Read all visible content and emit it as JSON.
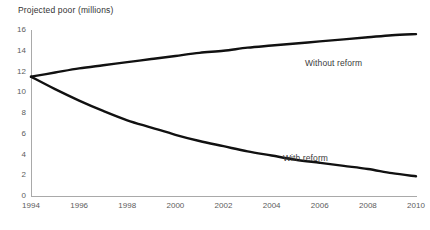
{
  "chart_data": {
    "type": "line",
    "title": "Projected poor (millions)",
    "xlabel": "",
    "ylabel": "Projected poor (millions)",
    "xlim": [
      1994,
      2010
    ],
    "ylim": [
      0,
      16
    ],
    "grid": false,
    "legend_position": "inline-annotation",
    "xticks": [
      "1994",
      "1996",
      "1998",
      "2000",
      "2002",
      "2004",
      "2006",
      "2008",
      "2010"
    ],
    "yticks": [
      "0",
      "2",
      "4",
      "6",
      "8",
      "10",
      "12",
      "14",
      "16"
    ],
    "x": [
      1994,
      1995,
      1996,
      1997,
      1998,
      1999,
      2000,
      2001,
      2002,
      2003,
      2004,
      2005,
      2006,
      2007,
      2008,
      2009,
      2010
    ],
    "series": [
      {
        "name": "Without reform",
        "color": "#111111",
        "values": [
          11.5,
          11.9,
          12.3,
          12.6,
          12.9,
          13.2,
          13.5,
          13.8,
          14.0,
          14.3,
          14.5,
          14.7,
          14.9,
          15.1,
          15.3,
          15.5,
          15.6
        ]
      },
      {
        "name": "With reform",
        "color": "#111111",
        "values": [
          11.5,
          10.3,
          9.2,
          8.2,
          7.3,
          6.6,
          5.9,
          5.3,
          4.8,
          4.3,
          3.9,
          3.5,
          3.2,
          2.9,
          2.6,
          2.2,
          1.9
        ]
      }
    ],
    "annotations": [
      {
        "text": "Without reform",
        "x": 2006.3,
        "y": 12.5
      },
      {
        "text": "With reform",
        "x": 2004.5,
        "y": 3.4
      }
    ]
  },
  "axis": {
    "line_color": "#a9a9a9"
  }
}
